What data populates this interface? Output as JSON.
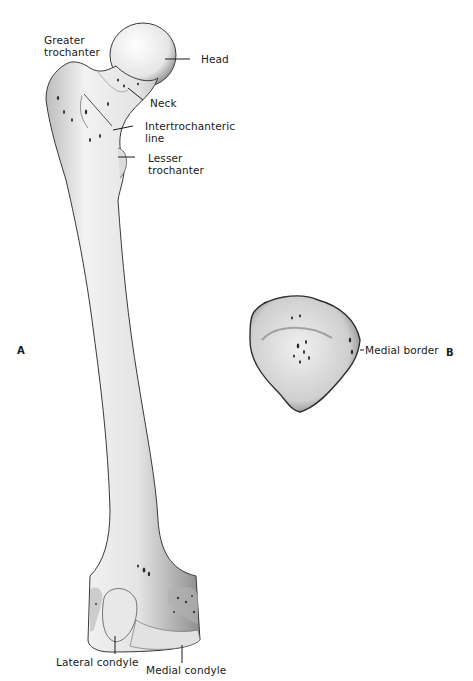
{
  "figure": {
    "panels": [
      {
        "id": "A",
        "label": "A",
        "subject": "Femur, anterior view"
      },
      {
        "id": "B",
        "label": "B",
        "subject": "Patella, posterior view"
      }
    ],
    "labels": {
      "greater_trochanter": {
        "line1": "Greater",
        "line2": "trochanter"
      },
      "head": "Head",
      "neck": "Neck",
      "intertrochanteric_line": {
        "line1": "Intertrochanteric",
        "line2": "line"
      },
      "lesser_trochanter": {
        "line1": "Lesser",
        "line2": "trochanter"
      },
      "lateral_condyle": "Lateral condyle",
      "medial_condyle": "Medial condyle",
      "medial_border": "Medial border"
    },
    "colors": {
      "background": "#ffffff",
      "bone_fill": "#ececec",
      "bone_shade": "#9a9a9a",
      "outline": "#2a2a2a",
      "text": "#1a1a1a"
    }
  }
}
